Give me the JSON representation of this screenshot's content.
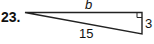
{
  "problem": {
    "number": "23."
  },
  "triangle": {
    "type": "right-triangle",
    "labels": {
      "top_side": "b",
      "right_side": "3",
      "hypotenuse": "15"
    },
    "right_angle_at": "top-right",
    "stroke_color": "#222222"
  }
}
